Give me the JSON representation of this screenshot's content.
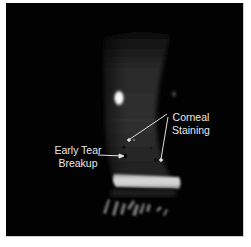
{
  "figure": {
    "annotations": {
      "corneal_staining": {
        "line1": "Corneal",
        "line2": "Staining"
      },
      "early_tear_breakup": {
        "line1": "Early Tear",
        "line2": "Breakup"
      }
    },
    "colors": {
      "background": "#020202",
      "label_text": "#e8e8e8",
      "arrow": "#e0e0e0"
    }
  }
}
